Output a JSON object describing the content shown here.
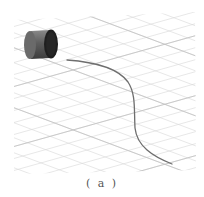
{
  "figure": {
    "caption": "( a )",
    "scene": {
      "description": "3D perspective ground grid with a cylinder and a curved trajectory",
      "objects": [
        {
          "type": "cylinder",
          "name": "cylinder",
          "color": "#5a5a5a",
          "face_color": "#1e1e1e"
        },
        {
          "type": "curve",
          "name": "trajectory-curve",
          "color": "#707070"
        }
      ],
      "grid_color": "#d4d4d4",
      "grid_major_color": "#bdbdbd"
    }
  }
}
